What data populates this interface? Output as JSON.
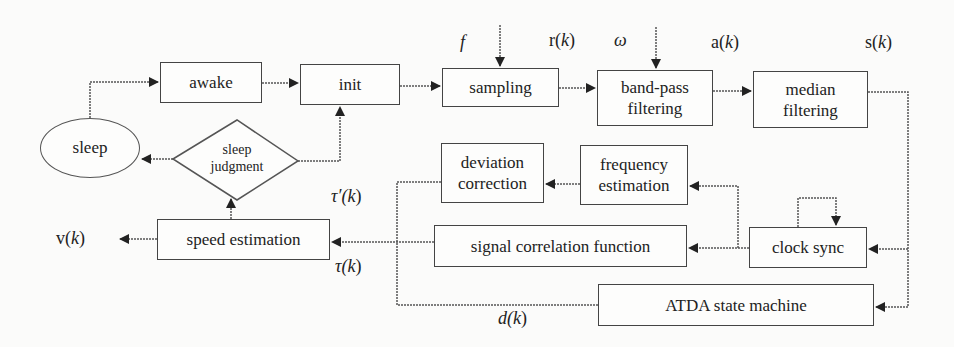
{
  "diagram": {
    "type": "flowchart",
    "nodes": {
      "sleep": "sleep",
      "awake": "awake",
      "init": "init",
      "sampling": "sampling",
      "band_pass_1": "band-pass",
      "band_pass_2": "filtering",
      "median_1": "median",
      "median_2": "filtering",
      "sleep_judgment_1": "sleep",
      "sleep_judgment_2": "judgment",
      "deviation_1": "deviation",
      "deviation_2": "correction",
      "frequency_1": "frequency",
      "frequency_2": "estimation",
      "signal_correlation": "signal correlation function",
      "clock_sync": "clock sync",
      "speed_estimation": "speed estimation",
      "atda": "ATDA state machine"
    },
    "labels": {
      "f": "f",
      "r_pre": "r(",
      "omega": "ω",
      "a_pre": "a(",
      "s_pre": "s(",
      "v_pre": "v(",
      "tau_prime_pre": "τ′(",
      "tau_pre": "τ(",
      "d_pre": "d(",
      "k": "k",
      "close": ")"
    },
    "edges": [
      [
        "sleep",
        "awake"
      ],
      [
        "awake",
        "init"
      ],
      [
        "init",
        "sampling"
      ],
      [
        "sampling",
        "band-pass filtering"
      ],
      [
        "band-pass filtering",
        "median filtering"
      ],
      [
        "median filtering",
        "clock sync"
      ],
      [
        "median filtering",
        "ATDA state machine"
      ],
      [
        "clock sync",
        "clock sync"
      ],
      [
        "clock sync",
        "signal correlation function"
      ],
      [
        "clock sync",
        "frequency estimation"
      ],
      [
        "frequency estimation",
        "deviation correction"
      ],
      [
        "signal correlation function",
        "speed estimation"
      ],
      [
        "ATDA state machine",
        "speed estimation"
      ],
      [
        "deviation correction",
        "speed estimation"
      ],
      [
        "speed estimation",
        "sleep judgment"
      ],
      [
        "speed estimation",
        "v(k)"
      ],
      [
        "sleep judgment",
        "sleep"
      ],
      [
        "sleep judgment",
        "init"
      ]
    ]
  }
}
